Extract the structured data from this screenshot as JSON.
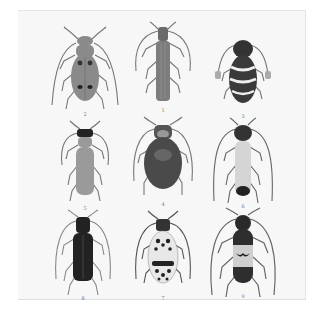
{
  "plate": {
    "background": "#f7f7f7",
    "figures": [
      {
        "label": "2",
        "name": "beetle-spotted-brown",
        "body": "#8a8a8a",
        "pattern": "four-dark-spots",
        "row": 0,
        "col": 0
      },
      {
        "label": "1",
        "name": "beetle-slender-grey",
        "body": "#7d7d7d",
        "pattern": "longitudinal-stripes",
        "row": 0,
        "col": 1
      },
      {
        "label": "3",
        "name": "beetle-banded-black",
        "body": "#3a3a3a",
        "pattern": "white-bands",
        "row": 0,
        "col": 2
      },
      {
        "label": "5",
        "name": "beetle-slim-tan",
        "body": "#9a9a9a",
        "pattern": "dark-pronotum",
        "row": 1,
        "col": 0
      },
      {
        "label": "4",
        "name": "beetle-broad-dark",
        "body": "#4a4a4a",
        "pattern": "plain",
        "row": 1,
        "col": 1
      },
      {
        "label": "6",
        "name": "beetle-pale-elytra",
        "body": "#d5d5d5",
        "pattern": "dark-tip",
        "row": 1,
        "col": 2
      },
      {
        "label": "8",
        "name": "beetle-black-glossy",
        "body": "#222222",
        "pattern": "plain",
        "row": 2,
        "col": 0
      },
      {
        "label": "7",
        "name": "beetle-mottled",
        "body": "#e8e8e8",
        "pattern": "black-mottling",
        "row": 2,
        "col": 1
      },
      {
        "label": "9",
        "name": "beetle-bicolor",
        "body": "#2e2e2e",
        "pattern": "pale-middle-band",
        "row": 2,
        "col": 2
      }
    ]
  }
}
